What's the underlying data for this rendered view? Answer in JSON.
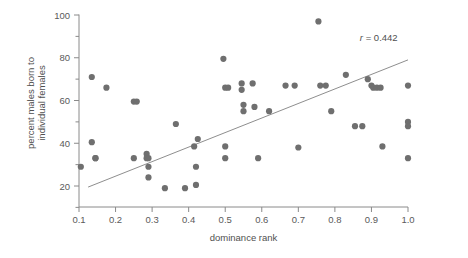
{
  "chart_data": {
    "type": "scatter",
    "title": "",
    "xlabel": "dominance rank",
    "ylabel": "percent males born to individual females",
    "ylabel_line1": "percent males born to",
    "ylabel_line2": "individual females",
    "xlim": [
      0.07,
      1.04
    ],
    "ylim": [
      14,
      102
    ],
    "xticks": [
      0.1,
      0.2,
      0.3,
      0.4,
      0.5,
      0.6,
      0.7,
      0.8,
      0.9,
      1.0
    ],
    "xticklabels": [
      "0.1",
      "0.2",
      "0.3",
      "0.4",
      "0.5",
      "0.6",
      "0.7",
      "0.8",
      "0.9",
      "1.0"
    ],
    "yticks": [
      20,
      40,
      60,
      80,
      100
    ],
    "yticklabels": [
      "20",
      "40",
      "60",
      "80",
      "100"
    ],
    "yminorticks": [
      30,
      50,
      70,
      90
    ],
    "grid": false,
    "legend": null,
    "annotations": [
      {
        "name": "correlation-coefficient",
        "text": "r = 0.442",
        "x": 0.92,
        "y": 88
      }
    ],
    "trendline": {
      "type": "linear-fit",
      "x0": 0.125,
      "y0": 19.5,
      "x1": 1.0,
      "y1": 79.0,
      "r": 0.442
    },
    "marker": {
      "shape": "circle",
      "size": 4.2,
      "color": "#6f6f6f"
    },
    "points": [
      {
        "x": 0.105,
        "y": 29
      },
      {
        "x": 0.135,
        "y": 71
      },
      {
        "x": 0.135,
        "y": 40.5
      },
      {
        "x": 0.145,
        "y": 33
      },
      {
        "x": 0.175,
        "y": 66
      },
      {
        "x": 0.25,
        "y": 59.5
      },
      {
        "x": 0.258,
        "y": 59.5
      },
      {
        "x": 0.25,
        "y": 33
      },
      {
        "x": 0.285,
        "y": 35
      },
      {
        "x": 0.285,
        "y": 33
      },
      {
        "x": 0.29,
        "y": 29
      },
      {
        "x": 0.29,
        "y": 24
      },
      {
        "x": 0.29,
        "y": 33
      },
      {
        "x": 0.335,
        "y": 19
      },
      {
        "x": 0.365,
        "y": 49
      },
      {
        "x": 0.39,
        "y": 19
      },
      {
        "x": 0.415,
        "y": 38.5
      },
      {
        "x": 0.42,
        "y": 29
      },
      {
        "x": 0.42,
        "y": 20.5
      },
      {
        "x": 0.425,
        "y": 42
      },
      {
        "x": 0.495,
        "y": 79.5
      },
      {
        "x": 0.5,
        "y": 66
      },
      {
        "x": 0.508,
        "y": 66
      },
      {
        "x": 0.5,
        "y": 38.5
      },
      {
        "x": 0.5,
        "y": 33
      },
      {
        "x": 0.545,
        "y": 68
      },
      {
        "x": 0.545,
        "y": 65
      },
      {
        "x": 0.55,
        "y": 58
      },
      {
        "x": 0.55,
        "y": 55
      },
      {
        "x": 0.575,
        "y": 68
      },
      {
        "x": 0.58,
        "y": 57
      },
      {
        "x": 0.59,
        "y": 33
      },
      {
        "x": 0.62,
        "y": 55
      },
      {
        "x": 0.665,
        "y": 67
      },
      {
        "x": 0.69,
        "y": 67
      },
      {
        "x": 0.7,
        "y": 38
      },
      {
        "x": 0.755,
        "y": 97
      },
      {
        "x": 0.76,
        "y": 67
      },
      {
        "x": 0.775,
        "y": 67
      },
      {
        "x": 0.79,
        "y": 55
      },
      {
        "x": 0.83,
        "y": 72
      },
      {
        "x": 0.855,
        "y": 48
      },
      {
        "x": 0.875,
        "y": 48
      },
      {
        "x": 0.89,
        "y": 70
      },
      {
        "x": 0.9,
        "y": 67
      },
      {
        "x": 0.905,
        "y": 66
      },
      {
        "x": 0.915,
        "y": 66
      },
      {
        "x": 0.925,
        "y": 66
      },
      {
        "x": 0.93,
        "y": 38.5
      },
      {
        "x": 1.0,
        "y": 67
      },
      {
        "x": 1.0,
        "y": 50
      },
      {
        "x": 1.0,
        "y": 48
      },
      {
        "x": 1.0,
        "y": 33
      },
      {
        "x": 0.145,
        "y": 33
      }
    ]
  },
  "axes": {
    "y_axis_name": "y-axis",
    "x_axis_name": "x-axis"
  }
}
